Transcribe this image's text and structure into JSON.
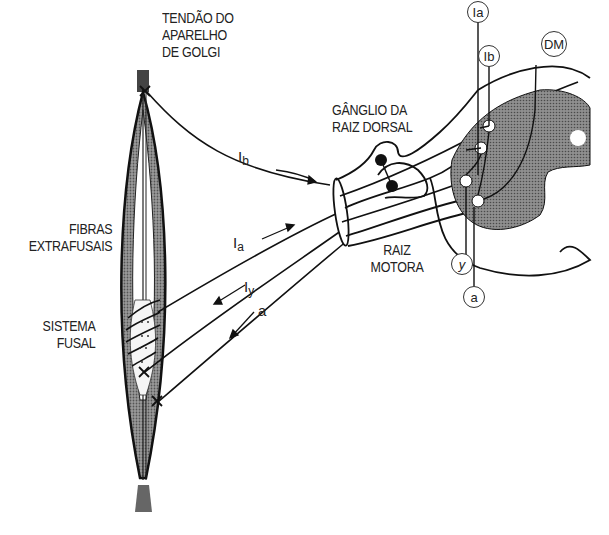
{
  "diagram": {
    "language": "pt",
    "labels": {
      "golgi_tendon": [
        "TENDÃO DO",
        "APARELHO",
        "DE GOLGI"
      ],
      "dorsal_root_ganglion": [
        "GÂNGLIO DA",
        "RAIZ DORSAL"
      ],
      "extrafusal_fibers": [
        "FIBRAS",
        "EXTRAFUSAIS"
      ],
      "spindle_system": [
        "SISTEMA",
        "FUSAL"
      ],
      "motor_root": [
        "RAIZ",
        "MOTORA"
      ]
    },
    "fibers": {
      "ib": {
        "main": "I",
        "sub": "b"
      },
      "ia": {
        "main": "I",
        "sub": "a"
      },
      "iy": {
        "main": "I",
        "sub": "y"
      },
      "a": {
        "main": "a",
        "sub": ""
      }
    },
    "spinal_markers": {
      "ia": "Ia",
      "ib": "Ib",
      "dm": "DM",
      "y": "y",
      "a": "a"
    },
    "colors": {
      "ink": "#1a1a1a",
      "grey_matter": "#8a8a8a",
      "muscle": "#7a7a7a"
    }
  }
}
